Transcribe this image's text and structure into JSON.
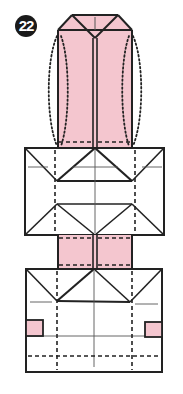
{
  "step": {
    "number": "22"
  },
  "colors": {
    "paper_color": "#f4c6cf",
    "line_color": "#222222",
    "background": "#ffffff"
  },
  "diagram": {
    "symbols": [
      "solid-edge",
      "valley-fold-dashed",
      "dotted-shaping-line",
      "diagonal-crease"
    ]
  }
}
